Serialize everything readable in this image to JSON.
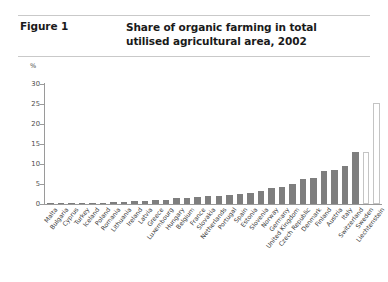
{
  "figure": {
    "label": "Figure 1",
    "title_line1": "Share of organic farming in total",
    "title_line2": "utilised agricultural area, 2002"
  },
  "chart_data": {
    "type": "bar",
    "title": "Share of organic farming in total utilised agricultural area, 2002",
    "xlabel": "",
    "ylabel": "%",
    "unit": "%",
    "ylim": [
      0,
      30
    ],
    "yticks": [
      0,
      5,
      10,
      15,
      20,
      25,
      30
    ],
    "grid": false,
    "legend": "none",
    "bar_color": "#7e7e7e",
    "highlight_color": "#ffffff",
    "highlight_border": "#c4c4c4",
    "categories": [
      "Malta",
      "Bulgaria",
      "Cyprus",
      "Turkey",
      "Iceland",
      "Poland",
      "Romania",
      "Lithuania",
      "Ireland",
      "Latvia",
      "Greece",
      "Luxembourg",
      "Hungary",
      "Belgium",
      "France",
      "Slovakia",
      "Netherlands",
      "Portugal",
      "Spain",
      "Estonia",
      "Slovenia",
      "Norway",
      "Germany",
      "United Kingdom",
      "Czech Republic",
      "Denmark",
      "Finland",
      "Austria",
      "Italy",
      "Switzerland",
      "Sweden",
      "Liechtenstein"
    ],
    "values": [
      0.1,
      0.1,
      0.2,
      0.2,
      0.3,
      0.3,
      0.4,
      0.5,
      0.7,
      0.8,
      0.9,
      1.0,
      1.4,
      1.6,
      1.7,
      2.0,
      2.1,
      2.2,
      2.4,
      2.7,
      3.3,
      3.9,
      4.3,
      5.1,
      6.3,
      6.6,
      8.2,
      8.5,
      9.5,
      13.0,
      13.0,
      25.2
    ],
    "highlight_indices": [
      30,
      31
    ]
  }
}
